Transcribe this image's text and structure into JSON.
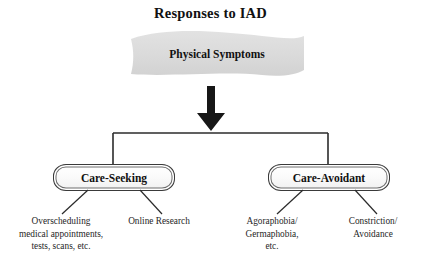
{
  "diagram": {
    "title": "Responses to IAD",
    "source_node": {
      "label": "Physical Symptoms",
      "shape": "wave-banner",
      "fill_color": "#dcdcdc"
    },
    "arrow": {
      "name": "down-arrow",
      "color": "#171717",
      "direction": "down"
    },
    "branches": [
      {
        "label": "Care-Seeking",
        "children": [
          "Overscheduling medical appointments, tests, scans, etc.",
          "Online Research"
        ]
      },
      {
        "label": "Care-Avoidant",
        "children": [
          "Agoraphobia/ Germaphobia, etc.",
          "Constriction/ Avoidance"
        ]
      }
    ],
    "leaves": [
      {
        "line1": "Overscheduling",
        "line2": "medical appointments,",
        "line3": "tests, scans, etc."
      },
      {
        "line1": "Online Research",
        "line2": "",
        "line3": ""
      },
      {
        "line1": "Agoraphobia/",
        "line2": "Germaphobia,",
        "line3": "etc."
      },
      {
        "line1": "Constriction/",
        "line2": "Avoidance",
        "line3": ""
      }
    ],
    "colors": {
      "background": "#ffffff",
      "line": "#2b2b2b",
      "text": "#1a1a1a",
      "box_border": "#6e6e6e"
    }
  }
}
